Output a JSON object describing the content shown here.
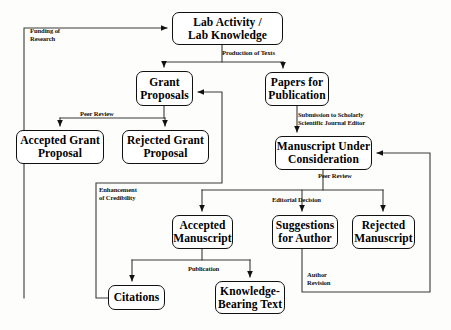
{
  "diagram": {
    "colors": {
      "stroke": "#111111",
      "node_fill": "#ffffff",
      "background": "#fdfdfb",
      "text": "#000000"
    },
    "nodes": [
      {
        "id": "lab",
        "label": "Lab  Activity /\nLab Knowledge",
        "x": 172,
        "y": 12,
        "w": 111,
        "h": 33,
        "font": 11.5
      },
      {
        "id": "grant",
        "label": "Grant\nProposals",
        "x": 136,
        "y": 71,
        "w": 57,
        "h": 35,
        "font": 11.5
      },
      {
        "id": "papers",
        "label": "Papers for\nPublication",
        "x": 265,
        "y": 72,
        "w": 64,
        "h": 34,
        "font": 11.5
      },
      {
        "id": "accgrant",
        "label": "Accepted Grant\nProposal",
        "x": 16,
        "y": 130,
        "w": 88,
        "h": 34,
        "font": 11.5
      },
      {
        "id": "rejgrant",
        "label": "Rejected Grant\nProposal",
        "x": 122,
        "y": 130,
        "w": 87,
        "h": 34,
        "font": 11.5
      },
      {
        "id": "manuscript",
        "label": "Manuscript Under\nConsideration",
        "x": 275,
        "y": 136,
        "w": 97,
        "h": 34,
        "font": 11.5
      },
      {
        "id": "accmanu",
        "label": "Accepted\nManuscript",
        "x": 172,
        "y": 215,
        "w": 61,
        "h": 34,
        "font": 11.5
      },
      {
        "id": "suggestions",
        "label": "Suggestions\nfor Author",
        "x": 272,
        "y": 215,
        "w": 66,
        "h": 34,
        "font": 11.5
      },
      {
        "id": "rejmanu",
        "label": "Rejected\nManuscript",
        "x": 352,
        "y": 215,
        "w": 63,
        "h": 34,
        "font": 11.5
      },
      {
        "id": "citations",
        "label": "Citations",
        "x": 108,
        "y": 285,
        "w": 57,
        "h": 25,
        "font": 11.5
      },
      {
        "id": "knowledge",
        "label": "Knowledge-\nBearing Text",
        "x": 215,
        "y": 281,
        "w": 70,
        "h": 33,
        "font": 11.5
      }
    ],
    "edge_labels": [
      {
        "id": "funding",
        "text": "Funding of\nResearch",
        "x": 30,
        "y": 27,
        "font": 6.6
      },
      {
        "id": "production",
        "text": "Production of Texts",
        "x": 222,
        "y": 49,
        "font": 6.6
      },
      {
        "id": "peerreview1",
        "text": "Peer Review",
        "x": 80,
        "y": 110,
        "font": 6.6
      },
      {
        "id": "submission",
        "text": "Submission to Scholarly\nScientific Journal Editor",
        "x": 298,
        "y": 111,
        "font": 6.6
      },
      {
        "id": "enhancement",
        "text": "Enhancement\nof Credibility",
        "x": 99,
        "y": 186,
        "font": 6.6
      },
      {
        "id": "peerreview2",
        "text": "Peer Review",
        "x": 318,
        "y": 172,
        "font": 6.6
      },
      {
        "id": "editorial",
        "text": "Editorial  Decision",
        "x": 272,
        "y": 196,
        "font": 6.6
      },
      {
        "id": "publication",
        "text": "Publication",
        "x": 188,
        "y": 265,
        "font": 6.6
      },
      {
        "id": "authorrev",
        "text": "Author\nRevision",
        "x": 307,
        "y": 271,
        "font": 6.6
      }
    ]
  }
}
